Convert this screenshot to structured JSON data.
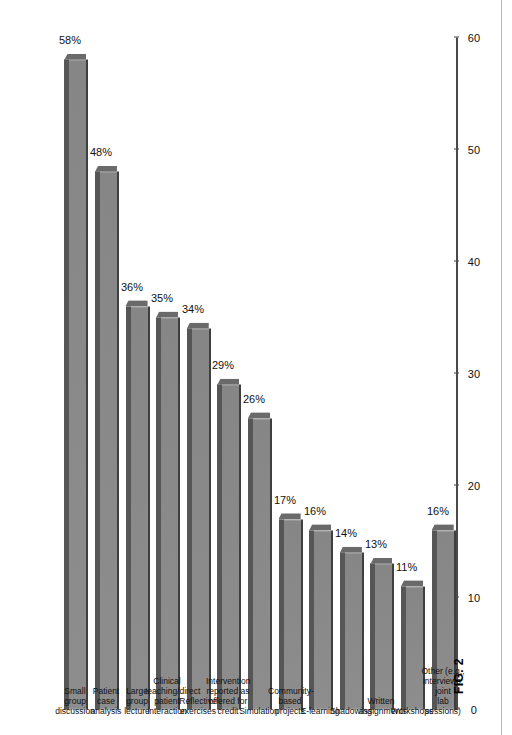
{
  "figure": {
    "caption": "FIG. 2"
  },
  "chart_data": {
    "type": "bar",
    "title": "",
    "xlabel": "",
    "ylabel": "",
    "orientation": "horizontal-bars-on-rotated-page",
    "grid": false,
    "legend": "none",
    "ylim": [
      0,
      60
    ],
    "tick_labels": [
      "0",
      "10",
      "20",
      "30",
      "40",
      "50",
      "60"
    ],
    "tick_values": [
      0,
      10,
      20,
      30,
      40,
      50,
      60
    ],
    "categories": [
      "Small group\ndiscussion",
      "Patient case\nanalysis",
      "Large group\nlecture",
      "Clinical\nteaching/direct\npatient\ninteraction",
      "Reflective\nexercises",
      "Intervention\nreported as\noffered for credit",
      "Simulation",
      "Community-\nbased projects",
      "E-learning",
      "Shadowing",
      "Written\nassignments",
      "Workshops",
      "Other (e.g.,\ninterviews, joint\nlab sessions)"
    ],
    "values": [
      58,
      48,
      36,
      35,
      34,
      29,
      26,
      17,
      16,
      14,
      13,
      11,
      16
    ],
    "value_labels": [
      "58%",
      "48%",
      "36%",
      "35%",
      "34%",
      "29%",
      "26%",
      "17%",
      "16%",
      "14%",
      "13%",
      "11%",
      "16%"
    ]
  },
  "colors": {
    "bar_face": "#8a8a8a",
    "bar_top": "#565656",
    "axis": "#4a4a4a",
    "text": "#111111",
    "rule": "#b9b9b9",
    "background": "#ffffff"
  }
}
